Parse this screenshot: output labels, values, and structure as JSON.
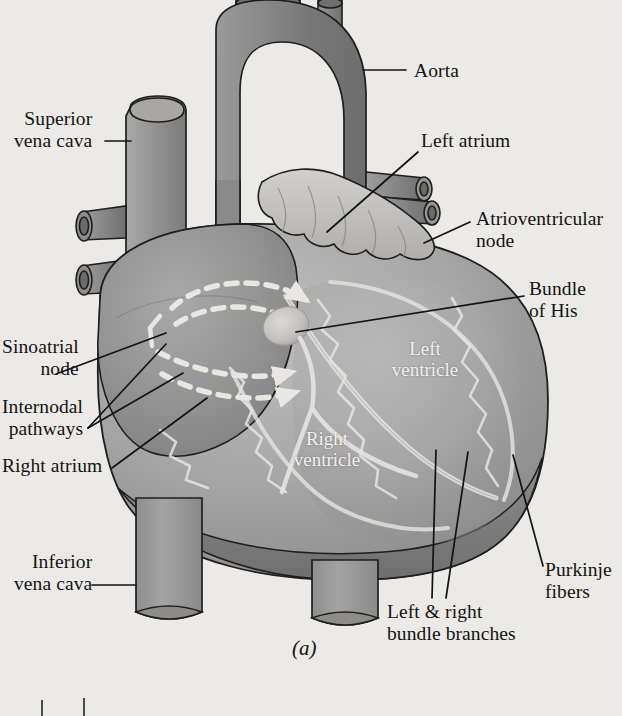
{
  "figure": {
    "caption": "(a)",
    "background_color": "#eceae6",
    "ink_color": "#131313"
  },
  "labels": [
    {
      "id": "aorta",
      "name": "aorta",
      "text": "Aorta",
      "lines": [
        "Aorta"
      ],
      "align": "left",
      "x": 414,
      "y": 60,
      "leader": {
        "x1": 406,
        "y1": 70,
        "x2": 363,
        "y2": 70
      }
    },
    {
      "id": "superior-vena-cava",
      "name": "superior-vena-cava",
      "text": "Superior vena cava",
      "lines": [
        "Superior",
        "vena cava"
      ],
      "align": "right",
      "x": 14,
      "y": 108,
      "leader": {
        "x1": 105,
        "y1": 141,
        "x2": 131,
        "y2": 141
      }
    },
    {
      "id": "left-atrium",
      "name": "left-atrium",
      "text": "Left atrium",
      "lines": [
        "Left atrium"
      ],
      "align": "left",
      "x": 421,
      "y": 130,
      "leader": {
        "x1": 418,
        "y1": 152,
        "x2": 327,
        "y2": 232
      }
    },
    {
      "id": "atrioventricular-node",
      "name": "atrioventricular-node",
      "text": "Atrioventricular node",
      "lines": [
        "Atrioventricular",
        "node"
      ],
      "align": "left",
      "x": 476,
      "y": 208,
      "leader": {
        "x1": 470,
        "y1": 222,
        "x2": 424,
        "y2": 243
      }
    },
    {
      "id": "bundle-of-his",
      "name": "bundle-of-his",
      "text": "Bundle of His",
      "lines": [
        "Bundle",
        "of His"
      ],
      "align": "left",
      "x": 529,
      "y": 278,
      "leader": {
        "x1": 524,
        "y1": 296,
        "x2": 296,
        "y2": 332
      }
    },
    {
      "id": "sinoatrial-node",
      "name": "sinoatrial-node",
      "text": "Sinoatrial node",
      "lines": [
        "Sinoatrial",
        "node"
      ],
      "align": "right",
      "x": 2,
      "y": 336,
      "leader": {
        "x1": 56,
        "y1": 374,
        "x2": 166,
        "y2": 333
      }
    },
    {
      "id": "internodal-pathways",
      "name": "internodal-pathways",
      "text": "Internodal pathways",
      "lines": [
        "Internodal",
        "pathways"
      ],
      "align": "right",
      "x": 2,
      "y": 396,
      "leader": {
        "x1": 88,
        "y1": 428,
        "x2": 166,
        "y2": 344
      },
      "leader2": {
        "x1": 88,
        "y1": 428,
        "x2": 183,
        "y2": 373
      }
    },
    {
      "id": "right-atrium",
      "name": "right-atrium",
      "text": "Right atrium",
      "lines": [
        "Right atrium"
      ],
      "align": "right",
      "x": 2,
      "y": 455,
      "leader": {
        "x1": 112,
        "y1": 468,
        "x2": 207,
        "y2": 398
      }
    },
    {
      "id": "inferior-vena-cava",
      "name": "inferior-vena-cava",
      "text": "Inferior vena cava",
      "lines": [
        "Inferior",
        "vena cava"
      ],
      "align": "right",
      "x": 14,
      "y": 551,
      "leader": {
        "x1": 92,
        "y1": 585,
        "x2": 136,
        "y2": 585
      }
    },
    {
      "id": "purkinje-fibers",
      "name": "purkinje-fibers",
      "text": "Purkinje fibers",
      "lines": [
        "Purkinje",
        "fibers"
      ],
      "align": "left",
      "x": 545,
      "y": 559,
      "leader": {
        "x1": 543,
        "y1": 566,
        "x2": 513,
        "y2": 455
      }
    },
    {
      "id": "left-and-right-bundle-branches",
      "name": "left-and-right-bundle-branches",
      "text": "Left & right bundle branches",
      "lines": [
        "Left & right",
        "bundle branches"
      ],
      "align": "left",
      "x": 387,
      "y": 601,
      "leader": {
        "x1": 432,
        "y1": 598,
        "x2": 436,
        "y2": 450
      },
      "leader2": {
        "x1": 446,
        "y1": 598,
        "x2": 468,
        "y2": 452
      }
    }
  ],
  "inner_labels": [
    {
      "id": "left-ventricle",
      "name": "left-ventricle",
      "text": "Left ventricle",
      "lines": [
        "Left",
        "ventricle"
      ],
      "x": 425,
      "y": 338
    },
    {
      "id": "right-ventricle",
      "name": "right-ventricle",
      "text": "Right ventricle",
      "lines": [
        "Right",
        "ventricle"
      ],
      "x": 327,
      "y": 428
    }
  ],
  "anatomy_colors": {
    "great_vessel_dark": "#7c7c7c",
    "great_vessel_mid": "#8d8d8d",
    "vein_light": "#a2a2a2",
    "atrium_mid": "#9b9b9b",
    "atrium_dark": "#848484",
    "ventricle_light": "#b4b4b4",
    "ventricle_mid": "#a0a0a0",
    "ventricle_dark": "#7e7e7e",
    "appendage_light": "#c6c4c0",
    "av_node_highlight": "#cfcdc9",
    "conduction_white": "#efeeea",
    "outline": "#1e1e1e"
  },
  "conduction_pathways": {
    "description": "Dashed white internodal pathway arrows sweeping from the sinoatrial node across the right atrium toward the atrioventricular node",
    "dash_color": "#e9e7e2",
    "arrow_count": 4
  }
}
